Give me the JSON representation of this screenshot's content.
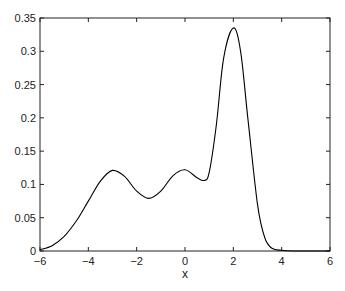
{
  "chart_data": {
    "type": "line",
    "title": "",
    "xlabel": "x",
    "ylabel": "",
    "xlim": [
      -6,
      6
    ],
    "ylim": [
      0,
      0.35
    ],
    "grid": false,
    "legend": null,
    "xticks": [
      -6,
      -4,
      -2,
      0,
      2,
      4,
      6
    ],
    "xtick_labels": [
      "-6",
      "-4",
      "-2",
      "0",
      "2",
      "4",
      "6"
    ],
    "yticks": [
      0,
      0.05,
      0.1,
      0.15,
      0.2,
      0.25,
      0.3,
      0.35
    ],
    "ytick_labels": [
      "0",
      "0.05",
      "0.1",
      "0.15",
      "0.2",
      "0.25",
      "0.3",
      "0.35"
    ],
    "series": [
      {
        "name": "density",
        "color": "#000000",
        "x": [
          -6,
          -5.5,
          -5,
          -4.5,
          -4,
          -3.5,
          -3,
          -2.5,
          -2,
          -1.5,
          -1,
          -0.5,
          0,
          0.5,
          0.8,
          1,
          1.3,
          1.6,
          2,
          2.3,
          2.6,
          3,
          3.3,
          3.6,
          4,
          4.5,
          5,
          5.5,
          6
        ],
        "values": [
          0.002,
          0.008,
          0.022,
          0.045,
          0.075,
          0.105,
          0.121,
          0.112,
          0.09,
          0.079,
          0.09,
          0.113,
          0.122,
          0.11,
          0.106,
          0.118,
          0.19,
          0.29,
          0.335,
          0.3,
          0.2,
          0.07,
          0.02,
          0.004,
          0.001,
          0,
          0,
          0,
          0
        ]
      }
    ]
  }
}
